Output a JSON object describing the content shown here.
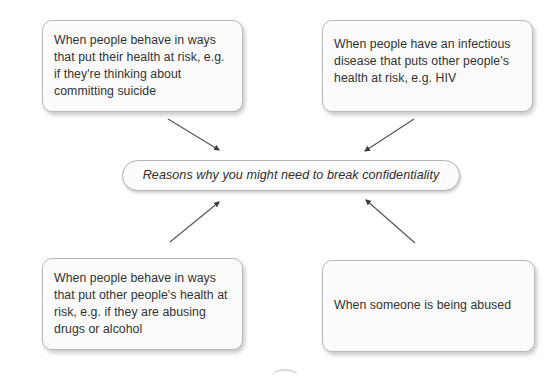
{
  "diagram": {
    "title": "Reasons why you might need to break confidentiality",
    "type": "hub-and-spoke concept map",
    "center": {
      "id": "central",
      "label": "Reasons why you might need to break confidentiality",
      "style": "italic"
    },
    "nodes": [
      {
        "id": "health-risk-self",
        "position": "top-left",
        "label": "When people behave in ways that put their health at risk, e.g. if they're thinking about committing suicide"
      },
      {
        "id": "infectious-disease",
        "position": "top-right",
        "label": "When people have an infectious disease that puts other people's health at risk, e.g. HIV"
      },
      {
        "id": "health-risk-others",
        "position": "bottom-left",
        "label": "When people behave in ways that put other people's health at risk, e.g. if they are abusing drugs or alcohol"
      },
      {
        "id": "someone-abused",
        "position": "bottom-right",
        "label": "When someone is being abused"
      }
    ],
    "arrows": [
      {
        "id": "arrow-from-health-risk-self",
        "from": "health-risk-self",
        "to": "central",
        "direction": "down-right"
      },
      {
        "id": "arrow-from-infectious-disease",
        "from": "infectious-disease",
        "to": "central",
        "direction": "down-left"
      },
      {
        "id": "arrow-from-health-risk-others",
        "from": "health-risk-others",
        "to": "central",
        "direction": "up-right"
      },
      {
        "id": "arrow-from-someone-abused",
        "from": "someone-abused",
        "to": "central",
        "direction": "up-left"
      }
    ],
    "colors": {
      "background": "#ffffff",
      "box_fill": "#fbfbfb",
      "box_border": "#b9b9b9",
      "text": "#333333",
      "arrow": "#545454"
    }
  }
}
